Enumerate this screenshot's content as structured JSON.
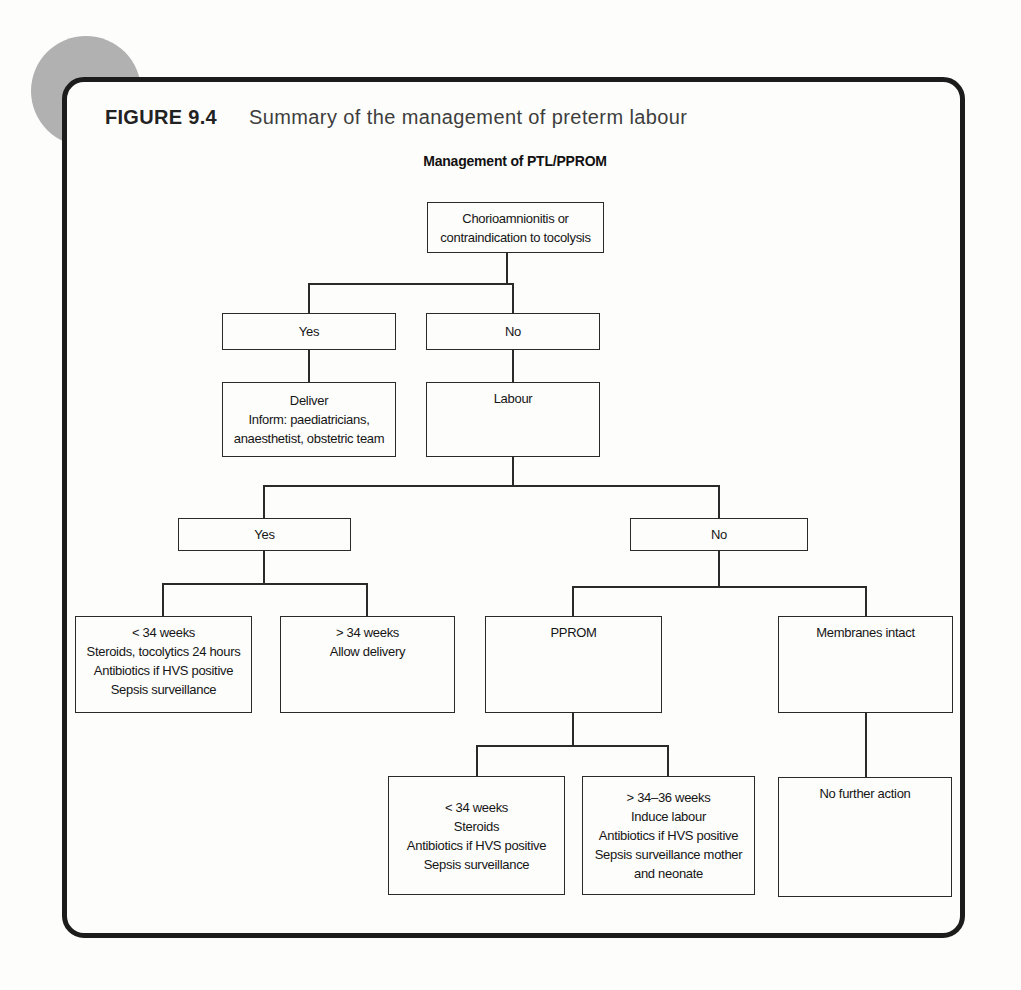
{
  "figure": {
    "label": "FIGURE 9.4",
    "title": "Summary of the management of preterm labour"
  },
  "diagram": {
    "title": "Management of PTL/PPROM",
    "nodes": {
      "root": "Chorioamnionitis or\ncontraindication to tocolysis",
      "yes1": "Yes",
      "no1": "No",
      "deliver": "Deliver\nInform: paediatricians,\nanaesthetist, obstetric team",
      "labour": "Labour",
      "yes2": "Yes",
      "no2": "No",
      "under34_tocolysis": "< 34 weeks\nSteroids, tocolytics 24 hours\nAntibiotics if HVS positive\nSepsis surveillance",
      "over34_allow": "> 34 weeks\nAllow delivery",
      "pprom": "PPROM",
      "membranes_intact": "Membranes intact",
      "under34_steroids": "< 34 weeks\nSteroids\nAntibiotics if HVS positive\nSepsis surveillance",
      "over34_36_induce": "> 34–36 weeks\nInduce labour\nAntibiotics if HVS positive\nSepsis surveillance mother\nand neonate",
      "no_further_action": "No further action"
    },
    "colors": {
      "line": "#2a2a2a",
      "frame": "#1c1c1c",
      "corner_circle": "#b1b1b1",
      "background": "#fdfdfc"
    }
  }
}
